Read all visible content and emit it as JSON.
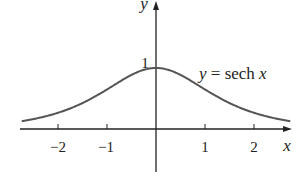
{
  "chart_data": {
    "type": "line",
    "title": "",
    "function_label": "y = sech x",
    "xlabel": "x",
    "ylabel": "y",
    "x_ticks": [
      -2,
      -1,
      1,
      2
    ],
    "x_tick_labels": [
      "−2",
      "−1",
      "1",
      "2"
    ],
    "y_ticks": [
      1
    ],
    "y_tick_labels": [
      "1"
    ],
    "xlim": [
      -2.75,
      2.75
    ],
    "ylim": [
      -0.7,
      2.1
    ],
    "grid": false,
    "legend": "none",
    "series": [
      {
        "name": "y = sech x",
        "x": [
          -2.7,
          -2.5,
          -2,
          -1.5,
          -1,
          -0.5,
          0,
          0.5,
          1,
          1.5,
          2,
          2.5,
          2.7
        ],
        "values": [
          0.134,
          0.163,
          0.266,
          0.425,
          0.648,
          0.887,
          1.0,
          0.887,
          0.648,
          0.425,
          0.266,
          0.163,
          0.134
        ]
      }
    ]
  },
  "labels": {
    "x_axis": "x",
    "y_axis": "y",
    "curve": "y = sech x",
    "y_tick_1": "1",
    "x_tick_m2": "−2",
    "x_tick_m1": "−1",
    "x_tick_1": "1",
    "x_tick_2": "2"
  },
  "colors": {
    "curve": "#555555",
    "axes": "#222222",
    "text": "#222222"
  }
}
